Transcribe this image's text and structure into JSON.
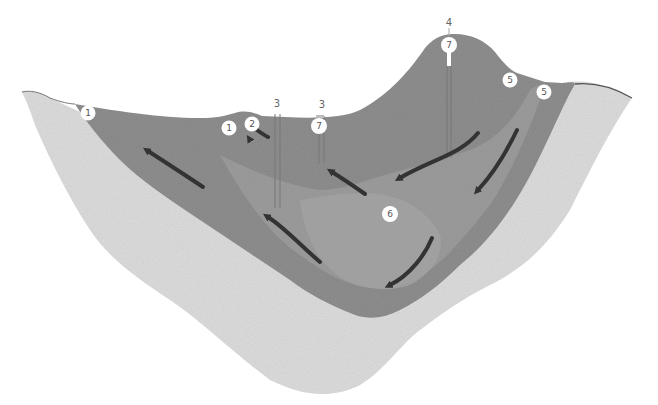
{
  "diagram": {
    "type": "geological-cross-section",
    "colors": {
      "background": "#ffffff",
      "bedrock": "#dcdcdc",
      "aquifer_outer": "#8e8e8e",
      "aquifer_inner": "#999999",
      "deep_zone": "#a3a3a3",
      "flow_arrow": "#333333",
      "label_circle": "#ffffff",
      "well_line": "#777777",
      "surface_line": "#555555"
    },
    "circle_labels": [
      {
        "id": "c1a",
        "text": "1",
        "x": 88,
        "y": 113
      },
      {
        "id": "c1b",
        "text": "1",
        "x": 229,
        "y": 128
      },
      {
        "id": "c2",
        "text": "2",
        "x": 252,
        "y": 124
      },
      {
        "id": "c7a",
        "text": "7",
        "x": 319,
        "y": 126
      },
      {
        "id": "c7b",
        "text": "7",
        "x": 449,
        "y": 45
      },
      {
        "id": "c5a",
        "text": "5",
        "x": 510,
        "y": 80
      },
      {
        "id": "c5b",
        "text": "5",
        "x": 544,
        "y": 92
      },
      {
        "id": "c6",
        "text": "6",
        "x": 390,
        "y": 214
      }
    ],
    "top_labels": [
      {
        "id": "t3a",
        "text": "3",
        "x": 277,
        "y": 106
      },
      {
        "id": "t3b",
        "text": "3",
        "x": 322,
        "y": 107
      },
      {
        "id": "t4",
        "text": "4",
        "x": 449,
        "y": 25
      }
    ],
    "flow_arrow_count": 8,
    "well_count": 4
  }
}
